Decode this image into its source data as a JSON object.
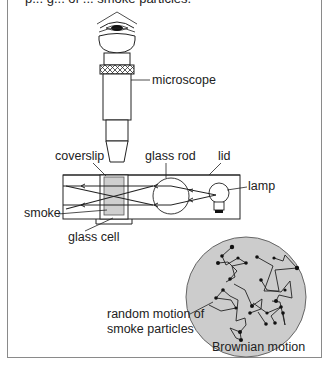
{
  "caption_clipped": "p... g... of ... smoke particles.",
  "labels": {
    "microscope": "microscope",
    "coverslip": "coverslip",
    "glass_rod": "glass rod",
    "lid": "lid",
    "lamp": "lamp",
    "smoke": "smoke",
    "glass_cell": "glass cell",
    "random_motion_line1": "random motion of",
    "random_motion_line2": "smoke particles",
    "brownian_motion": "Brownian motion"
  },
  "colors": {
    "line": "#222222",
    "smoke_fill": "#cfcfcf",
    "circle_fill": "#cccccc",
    "frame": "#8a8a8a"
  }
}
